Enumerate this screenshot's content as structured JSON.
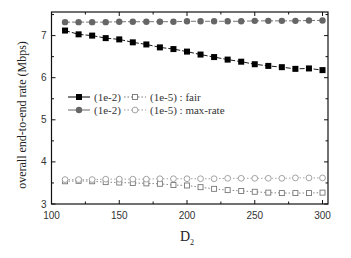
{
  "chart_data": {
    "type": "line",
    "title": "",
    "xlabel": "D",
    "xlabel_subscript": "2",
    "ylabel": "overall end-to-end rate (Mbps)",
    "xlim": [
      100,
      305
    ],
    "ylim": [
      3,
      7.55
    ],
    "xticks": [
      100,
      150,
      200,
      250,
      300
    ],
    "yticks": [
      3,
      4,
      5,
      6,
      7
    ],
    "grid": false,
    "legend_position": "center-left",
    "x": [
      110,
      120,
      130,
      140,
      150,
      160,
      170,
      180,
      190,
      200,
      210,
      220,
      230,
      240,
      250,
      260,
      270,
      280,
      290,
      300
    ],
    "series": [
      {
        "name": "(1e-2) fair",
        "marker": "filled-square",
        "line": "dashed",
        "color": "#000000",
        "values": [
          7.12,
          7.03,
          7.0,
          6.94,
          6.91,
          6.84,
          6.79,
          6.72,
          6.68,
          6.62,
          6.55,
          6.49,
          6.43,
          6.38,
          6.32,
          6.28,
          6.25,
          6.21,
          6.22,
          6.18
        ]
      },
      {
        "name": "(1e-5) fair",
        "marker": "open-square",
        "line": "dotted",
        "color": "#777777",
        "values": [
          3.54,
          3.55,
          3.54,
          3.52,
          3.51,
          3.5,
          3.49,
          3.48,
          3.45,
          3.44,
          3.4,
          3.36,
          3.33,
          3.31,
          3.29,
          3.27,
          3.26,
          3.26,
          3.26,
          3.27
        ]
      },
      {
        "name": "(1e-2) max-rate",
        "marker": "filled-circle",
        "line": "dashed",
        "color": "#666666",
        "values": [
          7.32,
          7.32,
          7.32,
          7.32,
          7.33,
          7.33,
          7.33,
          7.33,
          7.33,
          7.34,
          7.34,
          7.34,
          7.34,
          7.34,
          7.35,
          7.35,
          7.35,
          7.35,
          7.36,
          7.36
        ]
      },
      {
        "name": "(1e-5) max-rate",
        "marker": "open-circle",
        "line": "dotted",
        "color": "#999999",
        "values": [
          3.58,
          3.58,
          3.58,
          3.59,
          3.59,
          3.59,
          3.59,
          3.6,
          3.6,
          3.6,
          3.6,
          3.6,
          3.61,
          3.61,
          3.61,
          3.61,
          3.61,
          3.62,
          3.62,
          3.62
        ]
      }
    ],
    "legend": [
      {
        "left": "(1e-2)",
        "right": "(1e-5) : fair"
      },
      {
        "left": "(1e-2)",
        "right": "(1e-5) : max-rate"
      }
    ]
  }
}
